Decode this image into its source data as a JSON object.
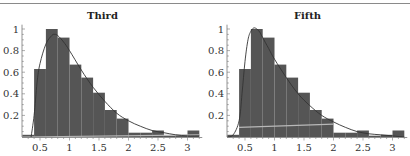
{
  "chart_data": [
    {
      "type": "bar",
      "title": "Third",
      "xlabel": "",
      "ylabel": "",
      "xlim": [
        0.2,
        3.25
      ],
      "ylim": [
        0,
        1.05
      ],
      "x_ticks": [
        "0.5",
        "1",
        "1.5",
        "2",
        "2.5",
        "3"
      ],
      "y_ticks": [
        "0.2",
        "0.4",
        "0.6",
        "0.8",
        "1"
      ],
      "grid": false,
      "bin_width": 0.2,
      "bin_edges": [
        0.2,
        0.4,
        0.6,
        0.8,
        1.0,
        1.2,
        1.4,
        1.6,
        1.8,
        2.0,
        2.2,
        2.4,
        2.6,
        2.8,
        3.0,
        3.2
      ],
      "values": [
        0.02,
        0.63,
        1.0,
        0.92,
        0.67,
        0.55,
        0.41,
        0.25,
        0.17,
        0.04,
        0.04,
        0.06,
        0.0,
        0.02,
        0.06
      ],
      "overlay_curve": {
        "name": "fitted density",
        "x": [
          0.35,
          0.4,
          0.45,
          0.5,
          0.6,
          0.7,
          0.75,
          0.8,
          0.9,
          1.0,
          1.2,
          1.4,
          1.6,
          1.8,
          2.0,
          2.2,
          2.4,
          2.6,
          2.8,
          3.0,
          3.2
        ],
        "y": [
          0.0,
          0.2,
          0.5,
          0.68,
          0.86,
          0.94,
          0.95,
          0.94,
          0.88,
          0.8,
          0.62,
          0.46,
          0.33,
          0.22,
          0.15,
          0.1,
          0.06,
          0.04,
          0.02,
          0.01,
          0.01
        ]
      },
      "baseline_line": {
        "name": "light reference line",
        "x": [
          0.2,
          3.2
        ],
        "y": [
          0.0,
          0.02
        ]
      }
    },
    {
      "type": "bar",
      "title": "Fifth",
      "xlabel": "",
      "ylabel": "",
      "xlim": [
        0.2,
        3.25
      ],
      "ylim": [
        0,
        1.05
      ],
      "x_ticks": [
        "0.5",
        "1",
        "1.5",
        "2",
        "2.5",
        "3"
      ],
      "y_ticks": [
        "0.2",
        "0.4",
        "0.6",
        "0.8",
        "1"
      ],
      "grid": false,
      "bin_width": 0.2,
      "bin_edges": [
        0.2,
        0.4,
        0.6,
        0.8,
        1.0,
        1.2,
        1.4,
        1.6,
        1.8,
        2.0,
        2.2,
        2.4,
        2.6,
        2.8,
        3.0,
        3.2
      ],
      "values": [
        0.02,
        0.63,
        1.0,
        0.92,
        0.67,
        0.55,
        0.41,
        0.25,
        0.17,
        0.04,
        0.04,
        0.06,
        0.0,
        0.02,
        0.06
      ],
      "overlay_curve": {
        "name": "fitted density",
        "x": [
          0.2,
          0.3,
          0.4,
          0.45,
          0.5,
          0.55,
          0.6,
          0.65,
          0.7,
          0.75,
          0.8,
          0.9,
          1.0,
          1.2,
          1.4,
          1.6,
          1.8,
          2.0,
          2.2,
          2.4,
          2.6,
          2.8,
          3.0,
          3.2
        ],
        "y": [
          0.0,
          0.02,
          0.15,
          0.4,
          0.7,
          0.9,
          0.98,
          1.01,
          1.0,
          0.97,
          0.92,
          0.82,
          0.72,
          0.55,
          0.4,
          0.29,
          0.2,
          0.14,
          0.09,
          0.05,
          0.03,
          0.02,
          0.01,
          0.0
        ]
      },
      "baseline_line": {
        "name": "light reference line",
        "x": [
          0.4,
          2.0
        ],
        "y": [
          0.09,
          0.12
        ]
      }
    }
  ],
  "panels": [
    {
      "title": "Third"
    },
    {
      "title": "Fifth"
    }
  ],
  "colors": {
    "bar_fill": "#555555",
    "curve": "#333333",
    "reference_line": "#b8b8b8",
    "axis": "#777777",
    "text": "#333333",
    "top_rule": "#8a8a8a"
  }
}
